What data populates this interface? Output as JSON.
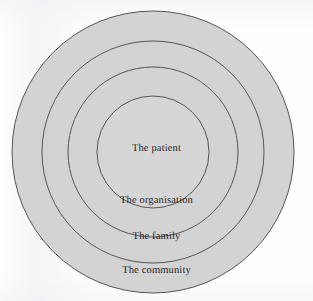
{
  "diagram": {
    "type": "concentric-circles",
    "title": "",
    "background_color": "#fefefe",
    "ring_fill_color": "#d3d3d3",
    "ring_stroke_color": "#555555",
    "label_color": "#232326",
    "center": {
      "x": 153,
      "y": 152
    },
    "rings": [
      {
        "id": "community",
        "label": "The community",
        "level": 4,
        "radius": 141,
        "label_position": {
          "x": 156,
          "y": 272
        }
      },
      {
        "id": "family",
        "label": "The family",
        "level": 3,
        "radius": 111,
        "label_position": {
          "x": 156,
          "y": 238
        }
      },
      {
        "id": "organisation",
        "label": "The organisation",
        "level": 2,
        "radius": 85,
        "label_position": {
          "x": 156,
          "y": 202
        }
      },
      {
        "id": "patient",
        "label": "The patient",
        "level": 1,
        "radius": 56,
        "label_position": {
          "x": 156,
          "y": 150
        }
      }
    ]
  }
}
